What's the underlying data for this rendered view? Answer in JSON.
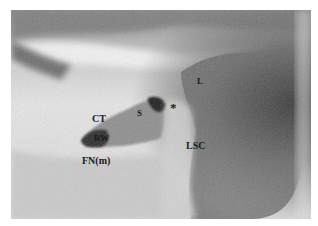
{
  "figure": {
    "labels": {
      "ct": "CT",
      "s": "S",
      "star": "*",
      "l": "L",
      "rw": "RW",
      "fn_m": "FN(m)",
      "lsc": "LSC"
    }
  }
}
